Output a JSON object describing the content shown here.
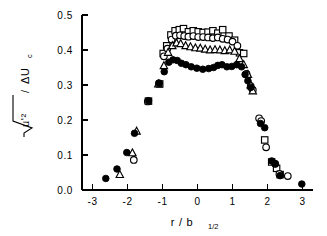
{
  "chart_data": {
    "type": "scatter",
    "title": "",
    "xlabel": "r / b_1/2",
    "xlabel_main": "r / b",
    "xlabel_sub": "1/2",
    "ylabel": "sqrt(u'^2) / ΔU_c",
    "ylabel_radicand": "u'²",
    "ylabel_denominator": "ΔU",
    "ylabel_denominator_sub": "c",
    "xlim": [
      -3.3,
      3.3
    ],
    "ylim": [
      0.0,
      0.5
    ],
    "xticks": [
      -3,
      -2,
      -1,
      0,
      1,
      2,
      3
    ],
    "xticklabels": [
      "-3",
      "-2",
      "-1",
      "0",
      "1",
      "2",
      "3"
    ],
    "yticks": [
      0.0,
      0.1,
      0.2,
      0.3,
      0.4,
      0.5
    ],
    "yticklabels": [
      "0.0",
      "0.1",
      "0.2",
      "0.3",
      "0.4",
      "0.5"
    ],
    "grid": false,
    "legend": "none",
    "marker_colors": {
      "open_stroke": "#000000",
      "open_fill": "#ffffff",
      "filled": "#000000"
    },
    "series": [
      {
        "name": "filled-circle",
        "marker": "circle",
        "style": "filled",
        "points": [
          [
            -2.62,
            0.033
          ],
          [
            -2.3,
            0.06
          ],
          [
            -2.02,
            0.107
          ],
          [
            -1.8,
            0.162
          ],
          [
            -1.4,
            0.255
          ],
          [
            -1.1,
            0.305
          ],
          [
            -0.95,
            0.338
          ],
          [
            -0.82,
            0.365
          ],
          [
            -0.7,
            0.372
          ],
          [
            -0.58,
            0.37
          ],
          [
            -0.46,
            0.362
          ],
          [
            -0.33,
            0.358
          ],
          [
            -0.18,
            0.352
          ],
          [
            -0.02,
            0.348
          ],
          [
            0.15,
            0.345
          ],
          [
            0.32,
            0.347
          ],
          [
            0.46,
            0.35
          ],
          [
            0.58,
            0.356
          ],
          [
            0.7,
            0.358
          ],
          [
            0.84,
            0.352
          ],
          [
            0.98,
            0.353
          ],
          [
            1.12,
            0.358
          ],
          [
            1.26,
            0.352
          ],
          [
            1.36,
            0.33
          ],
          [
            1.44,
            0.312
          ],
          [
            1.52,
            0.293
          ],
          [
            1.8,
            0.19
          ],
          [
            1.92,
            0.178
          ],
          [
            2.12,
            0.083
          ],
          [
            2.22,
            0.075
          ],
          [
            2.36,
            0.041
          ],
          [
            2.98,
            0.017
          ]
        ]
      },
      {
        "name": "open-circle",
        "marker": "circle",
        "style": "open",
        "points": [
          [
            -1.82,
            0.086
          ],
          [
            -1.42,
            0.253
          ],
          [
            -1.1,
            0.305
          ],
          [
            -0.96,
            0.382
          ],
          [
            -0.86,
            0.404
          ],
          [
            -0.74,
            0.43
          ],
          [
            -0.62,
            0.441
          ],
          [
            -0.5,
            0.442
          ],
          [
            -0.38,
            0.44
          ],
          [
            -0.26,
            0.438
          ],
          [
            -0.12,
            0.44
          ],
          [
            0.02,
            0.437
          ],
          [
            0.16,
            0.437
          ],
          [
            0.3,
            0.436
          ],
          [
            0.44,
            0.434
          ],
          [
            0.58,
            0.436
          ],
          [
            0.72,
            0.432
          ],
          [
            0.86,
            0.43
          ],
          [
            1.0,
            0.424
          ],
          [
            1.14,
            0.412
          ],
          [
            1.4,
            0.332
          ],
          [
            1.52,
            0.297
          ],
          [
            1.58,
            0.286
          ],
          [
            1.76,
            0.205
          ],
          [
            1.82,
            0.197
          ],
          [
            1.96,
            0.122
          ],
          [
            2.22,
            0.075
          ],
          [
            2.34,
            0.046
          ],
          [
            2.58,
            0.04
          ]
        ]
      },
      {
        "name": "open-triangle",
        "marker": "triangle",
        "style": "open",
        "points": [
          [
            -2.22,
            0.044
          ],
          [
            -1.86,
            0.106
          ],
          [
            -1.74,
            0.168
          ],
          [
            -1.12,
            0.303
          ],
          [
            -0.96,
            0.355
          ],
          [
            -0.84,
            0.393
          ],
          [
            -0.72,
            0.412
          ],
          [
            -0.6,
            0.42
          ],
          [
            -0.48,
            0.418
          ],
          [
            -0.34,
            0.412
          ],
          [
            -0.2,
            0.409
          ],
          [
            -0.06,
            0.406
          ],
          [
            0.08,
            0.405
          ],
          [
            0.22,
            0.402
          ],
          [
            0.36,
            0.4
          ],
          [
            0.5,
            0.401
          ],
          [
            0.64,
            0.4
          ],
          [
            0.78,
            0.398
          ],
          [
            0.92,
            0.4
          ],
          [
            1.06,
            0.396
          ],
          [
            1.2,
            0.375
          ],
          [
            1.32,
            0.358
          ],
          [
            1.44,
            0.33
          ],
          [
            1.52,
            0.3
          ],
          [
            1.58,
            0.283
          ]
        ]
      },
      {
        "name": "open-square",
        "marker": "square",
        "style": "open",
        "points": [
          [
            -1.4,
            0.254
          ],
          [
            -1.08,
            0.303
          ],
          [
            -0.98,
            0.39
          ],
          [
            -0.88,
            0.412
          ],
          [
            -0.76,
            0.443
          ],
          [
            -0.64,
            0.455
          ],
          [
            -0.52,
            0.458
          ],
          [
            -0.4,
            0.461
          ],
          [
            -0.26,
            0.452
          ],
          [
            -0.12,
            0.455
          ],
          [
            0.02,
            0.452
          ],
          [
            0.16,
            0.45
          ],
          [
            0.3,
            0.451
          ],
          [
            0.44,
            0.455
          ],
          [
            0.58,
            0.448
          ],
          [
            0.72,
            0.458
          ],
          [
            0.9,
            0.44
          ],
          [
            1.06,
            0.428
          ],
          [
            1.2,
            0.392
          ],
          [
            1.32,
            0.39
          ],
          [
            1.92,
            0.143
          ],
          [
            2.12,
            0.08
          ],
          [
            2.26,
            0.062
          ],
          [
            2.36,
            0.044
          ]
        ]
      }
    ]
  }
}
